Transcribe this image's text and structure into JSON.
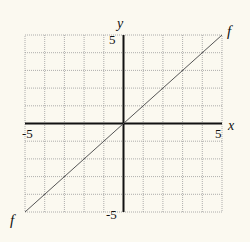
{
  "chart_data": {
    "type": "line",
    "title": "",
    "xlabel": "x",
    "ylabel": "y",
    "xlim": [
      -5,
      5
    ],
    "ylim": [
      -5,
      5
    ],
    "grid": true,
    "grid_step": 1,
    "x_tick_labels": [
      "-5",
      "5"
    ],
    "y_tick_labels": [
      "5",
      "-5"
    ],
    "series": [
      {
        "name": "f",
        "x": [
          -5,
          5
        ],
        "y": [
          -5,
          5
        ],
        "start_label": "f",
        "end_label": "f"
      }
    ]
  },
  "labels": {
    "x_axis": "x",
    "y_axis": "y",
    "x_min": "-5",
    "x_max": "5",
    "y_max": "5",
    "y_min": "-5",
    "curve_top": "f",
    "curve_bottom": "f"
  },
  "colors": {
    "background": "#fbf9f0",
    "grid": "#9a9a9a",
    "axis": "#111111",
    "curve": "#555555"
  }
}
